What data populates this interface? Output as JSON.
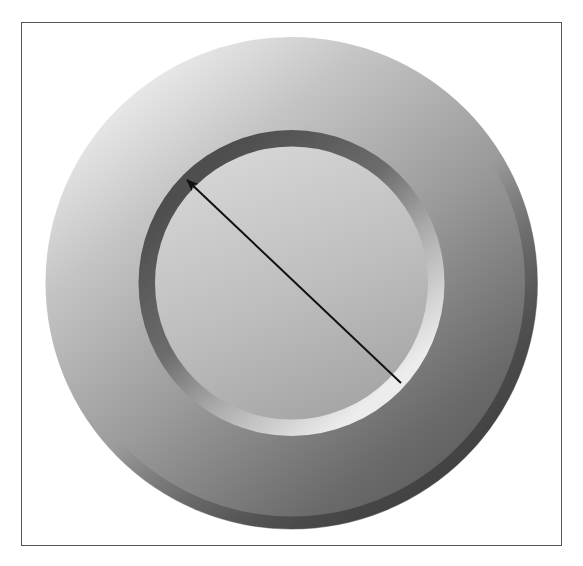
{
  "figure": {
    "frame": {
      "x": 21,
      "y": 22,
      "width": 540,
      "height": 523,
      "color": "#555555"
    },
    "outer_disc": {
      "cx": 291.5,
      "cy": 283,
      "r": 246,
      "colors": {
        "highlight": "#ececec",
        "mid": "#a9a9a9",
        "shadow": "#5e5e5e",
        "rim_shadow": "#484848"
      }
    },
    "inner_ring": {
      "cx": 291.5,
      "cy": 283,
      "r": 153,
      "colors": {
        "shadow_side": "#5a5a5a",
        "light_side": "#e6e6e6"
      }
    },
    "inner_face": {
      "cx": 291.5,
      "cy": 283,
      "r": 136,
      "colors": {
        "top": "#cfcfcf",
        "bottom": "#a8a8a8"
      }
    },
    "arrow": {
      "x1": 401,
      "y1": 383,
      "x2": 187,
      "y2": 180,
      "color": "#111111",
      "label": "inner diameter"
    }
  }
}
